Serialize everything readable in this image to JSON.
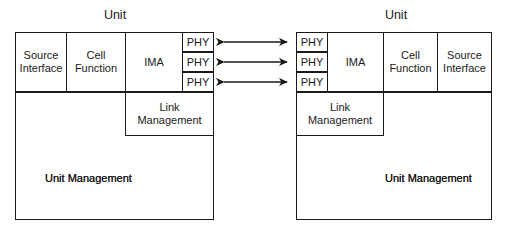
{
  "diagram": {
    "type": "block-diagram",
    "title_left": "Unit",
    "title_right": "Unit",
    "left_unit": {
      "title": "Unit",
      "blocks": {
        "source_interface": "Source\nInterface",
        "source_interface_line1": "Source",
        "source_interface_line2": "Interface",
        "cell_function_line1": "Cell",
        "cell_function_line2": "Function",
        "ima": "IMA",
        "phy_1": "PHY",
        "phy_2": "PHY",
        "phy_3": "PHY",
        "link_management_line1": "Link",
        "link_management_line2": "Management",
        "unit_management_line1": "Unit",
        "unit_management_line2": "Management"
      }
    },
    "right_unit": {
      "title": "Unit",
      "blocks": {
        "phy_1": "PHY",
        "phy_2": "PHY",
        "phy_3": "PHY",
        "ima": "IMA",
        "cell_function_line1": "Cell",
        "cell_function_line2": "Function",
        "source_interface_line1": "Source",
        "source_interface_line2": "Interface",
        "link_management_line1": "Link",
        "link_management_line2": "Management",
        "unit_management_line1": "Unit",
        "unit_management_line2": "Management"
      }
    },
    "connections": {
      "count": 3,
      "style": "double-headed-arrow",
      "description": "PHY to PHY bidirectional links"
    },
    "colors": {
      "line": "#1a1a1a",
      "background": "#ffffff",
      "text": "#1a1a1a"
    }
  }
}
